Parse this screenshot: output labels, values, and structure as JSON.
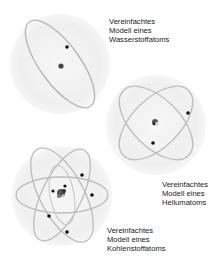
{
  "figure": {
    "colors": {
      "background": "#ffffff",
      "sphere": "#eeeeee",
      "orbit": "#b8b8b8",
      "electron": "#111111",
      "nucleus": "#555555"
    }
  },
  "atoms": [
    {
      "id": "hydrogen",
      "label_lines": [
        "Vereinfachtes",
        "Modell eines",
        "Wasserstoffatoms"
      ],
      "electron_count": 1,
      "orbit_count": 1
    },
    {
      "id": "helium",
      "label_lines": [
        "Vereinfachtes",
        "Modell eines",
        "Heliumatoms"
      ],
      "electron_count": 2,
      "orbit_count": 2
    },
    {
      "id": "carbon",
      "label_lines": [
        "Vereinfachtes",
        "Modell eines",
        "Kohlenstoffatoms"
      ],
      "electron_count": 6,
      "orbit_count": 3
    }
  ]
}
